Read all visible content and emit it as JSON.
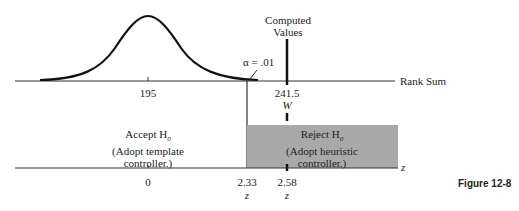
{
  "figure": {
    "caption": "Figure 12-8",
    "computed_values_label_line1": "Computed",
    "computed_values_label_line2": "Values",
    "alpha_label": "α = .01",
    "top_axis_label": "Rank Sum",
    "top_axis_ticks": {
      "mean": "195",
      "computed": "241.5",
      "computed_symbol": "W"
    },
    "bottom_axis_label": "z",
    "bottom_axis_ticks": {
      "zero": "0",
      "critical": "2.33",
      "critical_symbol": "z",
      "computed": "2.58",
      "computed_symbol": "z"
    },
    "accept_region": {
      "line1": "Accept H",
      "sub": "0",
      "line2": "(Adopt template",
      "line3": "controller.)"
    },
    "reject_region": {
      "line1": "Reject H",
      "sub": "0",
      "line2": "(Adopt heuristic",
      "line3": "controller.)",
      "fill": "#a9a9a9"
    }
  }
}
